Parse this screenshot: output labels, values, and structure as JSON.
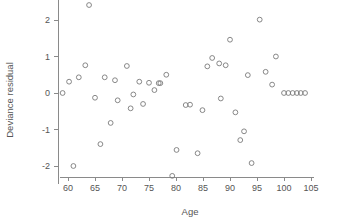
{
  "chart_data": {
    "type": "scatter",
    "title": "",
    "subtitle": "",
    "xlabel": "Age",
    "ylabel": "Deviance residual",
    "xlim": [
      58.5,
      105.5
    ],
    "ylim": [
      -2.5,
      2.55
    ],
    "xticks": [
      60,
      65,
      70,
      75,
      80,
      85,
      90,
      95,
      100,
      105
    ],
    "xtick_labels": [
      "60",
      "65",
      "70",
      "75",
      "80",
      "85",
      "90",
      "95",
      "100",
      "105"
    ],
    "yticks": [
      -2,
      -1,
      0,
      1,
      2
    ],
    "ytick_labels": [
      "-2",
      "-1",
      "0",
      "1",
      "2"
    ],
    "grid": false,
    "legend": false,
    "legend_position": "none",
    "marker": "open-circle",
    "marker_color": "#7a7a7a",
    "n_points": 52,
    "x": [
      59.0,
      60.2,
      61.0,
      62.0,
      63.2,
      63.9,
      65.0,
      66.0,
      66.8,
      67.9,
      68.7,
      69.2,
      70.9,
      71.6,
      72.1,
      73.2,
      73.9,
      75.0,
      76.0,
      76.8,
      77.1,
      78.2,
      79.3,
      80.1,
      81.8,
      82.6,
      84.0,
      84.9,
      85.8,
      86.7,
      88.0,
      88.3,
      89.2,
      90.0,
      91.0,
      91.9,
      92.6,
      93.3,
      94.0,
      95.5,
      96.6,
      97.8,
      98.5,
      100.0,
      100.8,
      101.6,
      102.4,
      103.1,
      103.9,
      64.0,
      80.0,
      95.2
    ],
    "y": [
      0.0,
      0.31,
      -2.0,
      0.43,
      0.76,
      2.41,
      -0.13,
      -1.4,
      0.43,
      -0.82,
      0.35,
      -0.2,
      0.74,
      -0.42,
      -0.04,
      0.31,
      -0.3,
      0.28,
      0.08,
      0.27,
      0.27,
      0.5,
      -2.27,
      -1.56,
      -0.33,
      -0.32,
      -1.65,
      -0.47,
      0.73,
      0.96,
      0.81,
      -0.15,
      0.76,
      1.46,
      -0.53,
      -1.29,
      -1.05,
      0.49,
      -1.92,
      2.01,
      0.58,
      0.23,
      1.0,
      0.0,
      0.0,
      0.0,
      0.0,
      0.0,
      0.0,
      2.41,
      -2.27,
      -1.92
    ],
    "points": [
      {
        "x": 59.0,
        "y": 0.0
      },
      {
        "x": 60.2,
        "y": 0.31
      },
      {
        "x": 61.0,
        "y": -2.0
      },
      {
        "x": 62.0,
        "y": 0.43
      },
      {
        "x": 63.2,
        "y": 0.76
      },
      {
        "x": 63.9,
        "y": 2.41
      },
      {
        "x": 65.0,
        "y": -0.13
      },
      {
        "x": 66.0,
        "y": -1.4
      },
      {
        "x": 66.8,
        "y": 0.43
      },
      {
        "x": 67.9,
        "y": -0.82
      },
      {
        "x": 68.7,
        "y": 0.35
      },
      {
        "x": 69.2,
        "y": -0.2
      },
      {
        "x": 70.9,
        "y": 0.74
      },
      {
        "x": 71.6,
        "y": -0.42
      },
      {
        "x": 72.1,
        "y": -0.04
      },
      {
        "x": 73.2,
        "y": 0.31
      },
      {
        "x": 73.9,
        "y": -0.3
      },
      {
        "x": 75.0,
        "y": 0.28
      },
      {
        "x": 76.0,
        "y": 0.08
      },
      {
        "x": 76.8,
        "y": 0.27
      },
      {
        "x": 77.1,
        "y": 0.27
      },
      {
        "x": 78.2,
        "y": 0.5
      },
      {
        "x": 79.3,
        "y": -2.27
      },
      {
        "x": 80.1,
        "y": -1.56
      },
      {
        "x": 81.8,
        "y": -0.33
      },
      {
        "x": 82.6,
        "y": -0.32
      },
      {
        "x": 84.0,
        "y": -1.65
      },
      {
        "x": 84.9,
        "y": -0.47
      },
      {
        "x": 85.8,
        "y": 0.73
      },
      {
        "x": 86.7,
        "y": 0.96
      },
      {
        "x": 88.0,
        "y": 0.81
      },
      {
        "x": 88.3,
        "y": -0.15
      },
      {
        "x": 89.2,
        "y": 0.76
      },
      {
        "x": 90.0,
        "y": 1.46
      },
      {
        "x": 91.0,
        "y": -0.53
      },
      {
        "x": 91.9,
        "y": -1.29
      },
      {
        "x": 92.6,
        "y": -1.05
      },
      {
        "x": 93.3,
        "y": 0.49
      },
      {
        "x": 94.0,
        "y": -1.92
      },
      {
        "x": 95.5,
        "y": 2.01
      },
      {
        "x": 96.6,
        "y": 0.58
      },
      {
        "x": 97.8,
        "y": 0.23
      },
      {
        "x": 98.5,
        "y": 1.0
      },
      {
        "x": 100.0,
        "y": 0.0
      },
      {
        "x": 100.8,
        "y": 0.0
      },
      {
        "x": 101.6,
        "y": 0.0
      },
      {
        "x": 102.4,
        "y": 0.0
      },
      {
        "x": 103.1,
        "y": 0.0
      },
      {
        "x": 103.9,
        "y": 0.0
      }
    ]
  }
}
